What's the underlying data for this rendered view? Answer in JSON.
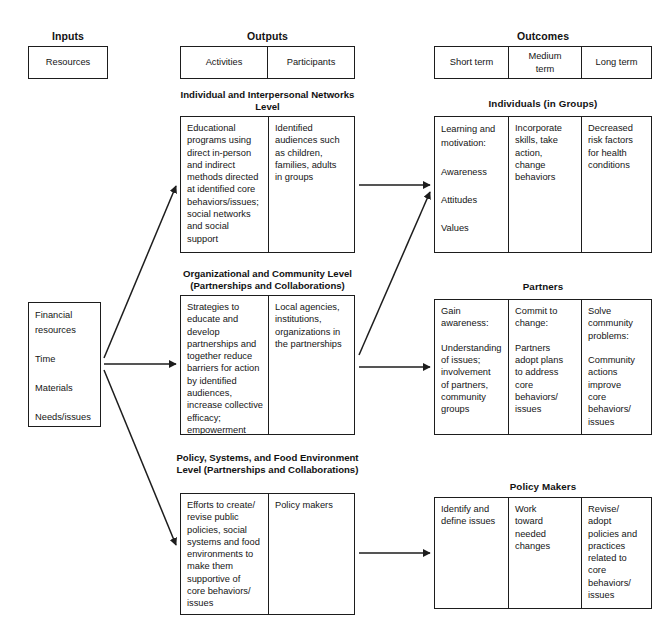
{
  "columns": {
    "inputs": "Inputs",
    "outputs": "Outputs",
    "outcomes": "Outcomes"
  },
  "header_boxes": {
    "inputs": {
      "cells": [
        "Resources"
      ]
    },
    "outputs": {
      "cells": [
        "Activities",
        "Participants"
      ]
    },
    "outcomes": {
      "cells": [
        "Short term",
        "Medium\nterm",
        "Long term"
      ]
    }
  },
  "inputs_box": {
    "cells": [
      "Financial\nresources\n\nTime\n\nMaterials\n\nNeeds/issues\nassessment\nprocess"
    ]
  },
  "levels": [
    {
      "title": "Individual and Interpersonal\nNetworks Level",
      "cells": [
        "Educational\nprograms using\ndirect in-person\nand indirect\nmethods directed\nat identified core\nbehaviors/issues;\nsocial networks\nand social\nsupport",
        "Identified\naudiences such\nas children,\nfamilies, adults\nin groups"
      ]
    },
    {
      "title": "Organizational and Community Level\n(Partnerships and Collaborations)",
      "cells": [
        "Strategies to\neducate and\ndevelop\npartnerships and\ntogether reduce\nbarriers for action\nby identified\naudiences,\nincrease collective\nefficacy;\nempowerment",
        "Local agencies,\ninstitutions,\norganizations in\nthe partnerships"
      ]
    },
    {
      "title": "Policy, Systems, and Food\nEnvironment Level\n(Partnerships and Collaborations)",
      "cells": [
        "Efforts to create/\nrevise public\npolicies, social\nsystems and food\nenvironments to\nmake them\nsupportive of\ncore behaviors/\nissues",
        "Policy makers"
      ]
    }
  ],
  "outcome_groups": [
    {
      "title": "Individuals (in Groups)",
      "cells": [
        "Learning and\nmotivation:\n\nAwareness\n\nAttitudes\n\nValues\n\nSkills",
        "Incorporate\nskills, take\naction,\nchange\nbehaviors",
        "Decreased\nrisk factors\nfor health\nconditions"
      ]
    },
    {
      "title": "Partners",
      "cells": [
        "Gain\nawareness:\n\nUnderstanding\nof issues;\ninvolvement\nof partners,\ncommunity\ngroups",
        "Commit to\nchange:\n\nPartners\nadopt plans\nto address\ncore\nbehaviors/\nissues",
        "Solve\ncommunity\nproblems:\n\nCommunity\nactions\nimprove\ncore\nbehaviors/\nissues"
      ]
    },
    {
      "title": "Policy Makers",
      "cells": [
        "Identify and\ndefine issues",
        "Work\ntoward\nneeded\nchanges",
        "Revise/\nadopt\npolicies and\npractices\nrelated to\ncore\nbehaviors/\nissues"
      ]
    }
  ],
  "colors": {
    "line": "#1d1d1d",
    "text": "#151515",
    "background": "#ffffff"
  }
}
